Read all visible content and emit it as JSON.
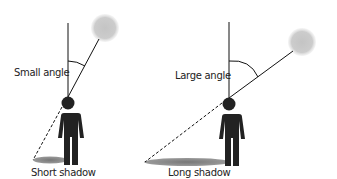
{
  "diagram": {
    "left": {
      "angle_label": "Small angle",
      "shadow_label": "Short shadow"
    },
    "right": {
      "angle_label": "Large angle",
      "shadow_label": "Long shadow"
    },
    "colors": {
      "sun": "#c8c8c8",
      "person": "#222222",
      "shadow": "#8a8a8a",
      "line": "#111111"
    }
  }
}
